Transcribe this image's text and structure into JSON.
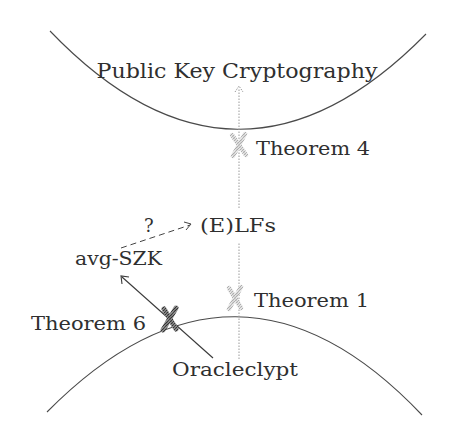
{
  "diagram": {
    "top_region": {
      "label": "Public Key Cryptography"
    },
    "bottom_region": {
      "label": "Oracleclypt"
    },
    "nodes": {
      "elfs": {
        "label": "(E)LFs"
      },
      "avg_szk": {
        "label": "avg-SZK"
      }
    },
    "separations": [
      {
        "id": "theorem-4",
        "label": "Theorem 4",
        "style": "light-hatched-cross"
      },
      {
        "id": "theorem-1",
        "label": "Theorem 1",
        "style": "light-hatched-cross"
      },
      {
        "id": "theorem-6",
        "label": "Theorem 6",
        "style": "dark-hatched-cross"
      }
    ],
    "edges": [
      {
        "from": "Oracleclypt",
        "to": "Public Key Cryptography",
        "style": "dotted-arrow"
      },
      {
        "from": "Oracleclypt",
        "to": "avg-SZK",
        "style": "solid-arrow"
      },
      {
        "from": "avg-SZK",
        "to": "(E)LFs",
        "style": "dashed-arrow",
        "label": "?"
      }
    ],
    "question_mark": "?",
    "colors": {
      "ink": "#2f2f2f",
      "light_cross": "#b8b8b8",
      "dark_cross": "#555555",
      "dotted": "#9a9a9a"
    }
  }
}
